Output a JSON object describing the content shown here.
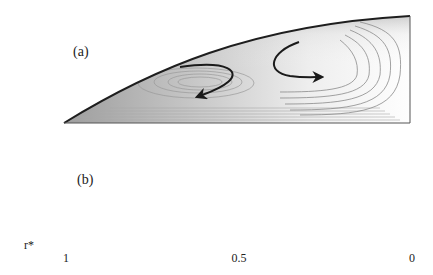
{
  "figure": {
    "panels": [
      {
        "id": "a",
        "label": "(a)",
        "vortices": 2,
        "description": "Streamline contours in tapered cavity with two counter-rotating cells"
      },
      {
        "id": "b",
        "label": "(b)",
        "vortices": 1,
        "description": "Streamline contours in tapered cavity with a single recirculation cell"
      }
    ],
    "axis": {
      "variable": "r*",
      "ticks": [
        {
          "value": 1,
          "label": "1"
        },
        {
          "value": 0.5,
          "label": "0.5"
        },
        {
          "value": 0,
          "label": "0"
        }
      ],
      "direction": "increasing-leftward"
    },
    "colors": {
      "line": "#222222",
      "contour": "#8a8a8a",
      "shade_dark": "#9a9a9a",
      "background": "#ffffff"
    }
  }
}
